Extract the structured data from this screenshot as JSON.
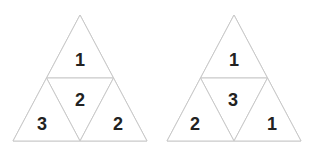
{
  "figure": {
    "type": "triangle-subdivision-diagram",
    "background_color": "#ffffff",
    "stroke_color": "#c9c9c9",
    "label_color": "#222222",
    "figure_count": 2
  },
  "figures": [
    {
      "id": "left",
      "name": "left-triangle",
      "shape": "equilateral-triangle",
      "subdivisions": 4,
      "cells": [
        {
          "position": "top",
          "label": "1"
        },
        {
          "position": "middle-center",
          "label": "2"
        },
        {
          "position": "bottom-left",
          "label": "3"
        },
        {
          "position": "bottom-right",
          "label": "2"
        }
      ]
    },
    {
      "id": "right",
      "name": "right-triangle",
      "shape": "equilateral-triangle",
      "subdivisions": 4,
      "cells": [
        {
          "position": "top",
          "label": "1"
        },
        {
          "position": "middle-center",
          "label": "3"
        },
        {
          "position": "bottom-left",
          "label": "2"
        },
        {
          "position": "bottom-right",
          "label": "1"
        }
      ]
    }
  ]
}
